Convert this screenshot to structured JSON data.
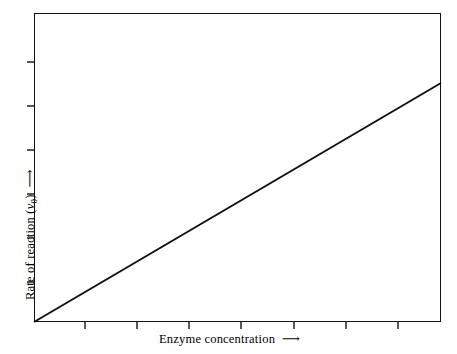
{
  "figure": {
    "background_color": "#ffffff",
    "ink_color": "#111111",
    "frame": {
      "left": 34,
      "top": 13,
      "width": 407,
      "height": 309
    }
  },
  "axes": {
    "x": {
      "title_text": "Enzyme concentration",
      "arrow_glyph": "⟶",
      "tick_positions_px": [
        85,
        137,
        189,
        241,
        294,
        346,
        398
      ],
      "tick_length_px": 7,
      "tick_side": "outside-below",
      "tick_labels": []
    },
    "y": {
      "title_prefix": "Rate of reaction (",
      "title_symbol": "v",
      "title_subscript": "0",
      "title_suffix": ")",
      "arrow_glyph": "⟶",
      "tick_positions_px": [
        62,
        106,
        150,
        194,
        238,
        282
      ],
      "tick_length_px": 7,
      "tick_side": "outside-left",
      "tick_labels": []
    }
  },
  "chart_data": {
    "type": "line",
    "title": "",
    "subtitle": "",
    "xlabel": "Enzyme concentration ⟶",
    "ylabel": "Rate of reaction (v₀) ⟶",
    "grid": false,
    "legend": false,
    "legend_position": "none",
    "xlim": [
      0,
      1
    ],
    "ylim": [
      0,
      1
    ],
    "x_tick_labels": [],
    "y_tick_labels": [],
    "annotations": [],
    "series": [
      {
        "name": "Rate of reaction vs enzyme concentration",
        "style": "solid-straight-line",
        "color": "#111111",
        "line_width_px": 2,
        "relationship": "directly proportional (linear through origin)",
        "x": [
          0.0,
          0.125,
          0.25,
          0.375,
          0.5,
          0.625,
          0.75,
          0.875,
          1.0
        ],
        "y": [
          0.0,
          0.0968,
          0.1935,
          0.2903,
          0.3871,
          0.4839,
          0.5806,
          0.6774,
          0.7735
        ],
        "endpoints_px": {
          "start": [
            34,
            322
          ],
          "end": [
            441,
            83
          ]
        }
      }
    ]
  }
}
